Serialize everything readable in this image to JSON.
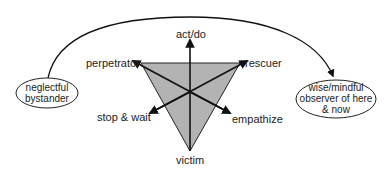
{
  "diagram": {
    "colors": {
      "triangle_fill": "#b3b3b3",
      "stroke": "#111111",
      "text": "#222222",
      "background": "#ffffff"
    },
    "triangle": {
      "vertices": {
        "perpetrator": [
          141,
          63
        ],
        "rescuer": [
          240,
          63
        ],
        "victim": [
          190,
          151
        ]
      },
      "center": [
        190,
        92
      ]
    },
    "vertex_labels": {
      "perpetrator": "perpetrator",
      "rescuer": "rescuer",
      "victim": "victim"
    },
    "arrow_labels": {
      "act_do": "act/do",
      "stop_wait": "stop & wait",
      "empathize": "empathize"
    },
    "left_node": {
      "line1": "neglectful",
      "line2": "bystander"
    },
    "right_node": {
      "line1": "wise/mindful",
      "line2": "observer of here",
      "line3": "& now"
    },
    "transition_arc": {
      "from": "neglectful bystander",
      "to": "wise/mindful observer of here & now",
      "icon": "curved-arrow"
    }
  }
}
